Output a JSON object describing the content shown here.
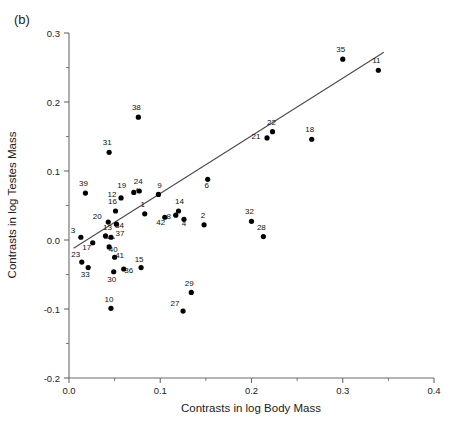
{
  "panel": {
    "label": "(b)"
  },
  "chart_data": {
    "type": "scatter",
    "title": "",
    "xlabel": "Contrasts in log Body Mass",
    "ylabel": "Contrasts in log Testes Mass",
    "xlim": [
      0.0,
      0.4
    ],
    "ylim": [
      -0.2,
      0.3
    ],
    "xticks": [
      0.0,
      0.1,
      0.2,
      0.3,
      0.4
    ],
    "xtick_labels": [
      "0.0",
      "0.1",
      "0.2",
      "0.3",
      "0.4"
    ],
    "yticks": [
      -0.2,
      -0.1,
      0.0,
      0.1,
      0.2,
      0.3
    ],
    "ytick_labels": [
      "-0.2",
      "-0.1",
      "0.0",
      "0.1",
      "0.2",
      "0.3"
    ],
    "minor_ticks": true,
    "grid": false,
    "legend": "none",
    "point_labels_shown": true,
    "trendline": {
      "type": "linear",
      "x": [
        0.005,
        0.345
      ],
      "y": [
        -0.012,
        0.272
      ]
    },
    "points": [
      {
        "label": "39",
        "x": 0.018,
        "y": 0.068
      },
      {
        "label": "31",
        "x": 0.044,
        "y": 0.127
      },
      {
        "label": "38",
        "x": 0.076,
        "y": 0.178
      },
      {
        "label": "12",
        "x": 0.057,
        "y": 0.061
      },
      {
        "label": "19",
        "x": 0.071,
        "y": 0.069
      },
      {
        "label": "24",
        "x": 0.077,
        "y": 0.071
      },
      {
        "label": "9",
        "x": 0.098,
        "y": 0.066
      },
      {
        "label": "16",
        "x": 0.051,
        "y": 0.042
      },
      {
        "label": "1",
        "x": 0.083,
        "y": 0.038
      },
      {
        "label": "20",
        "x": 0.043,
        "y": 0.026
      },
      {
        "label": "34",
        "x": 0.052,
        "y": 0.023
      },
      {
        "label": "14",
        "x": 0.12,
        "y": 0.042
      },
      {
        "label": "8",
        "x": 0.117,
        "y": 0.036
      },
      {
        "label": "42",
        "x": 0.105,
        "y": 0.033
      },
      {
        "label": "4",
        "x": 0.126,
        "y": 0.03
      },
      {
        "label": "3",
        "x": 0.013,
        "y": 0.004
      },
      {
        "label": "13",
        "x": 0.04,
        "y": 0.006
      },
      {
        "label": "37",
        "x": 0.046,
        "y": 0.004
      },
      {
        "label": "17",
        "x": 0.026,
        "y": -0.004
      },
      {
        "label": "40",
        "x": 0.044,
        "y": -0.01
      },
      {
        "label": "2",
        "x": 0.148,
        "y": 0.022
      },
      {
        "label": "6",
        "x": 0.152,
        "y": 0.088
      },
      {
        "label": "32",
        "x": 0.2,
        "y": 0.027
      },
      {
        "label": "28",
        "x": 0.213,
        "y": 0.005
      },
      {
        "label": "21",
        "x": 0.217,
        "y": 0.148
      },
      {
        "label": "22",
        "x": 0.223,
        "y": 0.157
      },
      {
        "label": "18",
        "x": 0.266,
        "y": 0.146
      },
      {
        "label": "35",
        "x": 0.3,
        "y": 0.262
      },
      {
        "label": "11",
        "x": 0.339,
        "y": 0.246
      },
      {
        "label": "41",
        "x": 0.05,
        "y": -0.025
      },
      {
        "label": "23",
        "x": 0.014,
        "y": -0.032
      },
      {
        "label": "33",
        "x": 0.021,
        "y": -0.04
      },
      {
        "label": "36",
        "x": 0.06,
        "y": -0.042
      },
      {
        "label": "30",
        "x": 0.049,
        "y": -0.046
      },
      {
        "label": "15",
        "x": 0.079,
        "y": -0.04
      },
      {
        "label": "10",
        "x": 0.046,
        "y": -0.099
      },
      {
        "label": "29",
        "x": 0.134,
        "y": -0.076
      },
      {
        "label": "27",
        "x": 0.125,
        "y": -0.103
      }
    ],
    "label_leaders": [
      {
        "label": "19",
        "from": [
          0.075,
          0.0755
        ],
        "to": [
          0.0735,
          0.0705
        ]
      },
      {
        "label": "37",
        "from": [
          0.0385,
          0.0025
        ],
        "to": [
          0.0505,
          0.0025
        ]
      }
    ],
    "label_offsets": {
      "39": [
        -2,
        -7
      ],
      "31": [
        -2,
        -7
      ],
      "38": [
        -2,
        -7
      ],
      "12": [
        -9,
        -1
      ],
      "19": [
        -12,
        -4
      ],
      "24": [
        -1,
        -7
      ],
      "9": [
        1,
        -6
      ],
      "16": [
        -3,
        -7
      ],
      "1": [
        -2,
        -7
      ],
      "20": [
        -11,
        -3
      ],
      "34": [
        3,
        4
      ],
      "14": [
        1,
        -7
      ],
      "8": [
        -7,
        4
      ],
      "42": [
        -4,
        8
      ],
      "4": [
        0,
        7
      ],
      "3": [
        -8,
        -4
      ],
      "13": [
        2,
        -6
      ],
      "37": [
        9,
        -1
      ],
      "17": [
        -6,
        7
      ],
      "40": [
        4,
        5
      ],
      "2": [
        -1,
        -7
      ],
      "6": [
        -1,
        9
      ],
      "32": [
        -2,
        -7
      ],
      "28": [
        -2,
        -7
      ],
      "21": [
        -11,
        1
      ],
      "22": [
        -1,
        -7
      ],
      "18": [
        -2,
        -7
      ],
      "35": [
        -2,
        -7
      ],
      "11": [
        -2,
        -7
      ],
      "41": [
        5,
        1
      ],
      "23": [
        -6,
        -5
      ],
      "33": [
        -3,
        9
      ],
      "36": [
        5,
        4
      ],
      "30": [
        -2,
        10
      ],
      "15": [
        -2,
        -6
      ],
      "10": [
        -2,
        -6
      ],
      "29": [
        -2,
        -6
      ],
      "27": [
        -8,
        -5
      ]
    }
  }
}
